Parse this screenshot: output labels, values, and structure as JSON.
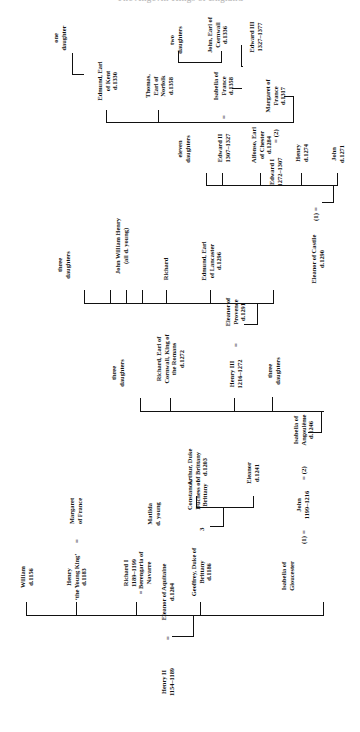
{
  "document": {
    "title": "The Angevin Kings of England",
    "kind": "genealogical-table",
    "orientation": "rotated-90-ccw"
  },
  "root": {
    "husband": {
      "name": "Henry II",
      "dates": "1154–1189"
    },
    "marriage_symbol": "=",
    "wife": {
      "name": "Eleanor of Aquitaine",
      "dates": "d.1204"
    }
  },
  "generation2": [
    {
      "id": "william",
      "lines": [
        "William",
        "d.1156"
      ]
    },
    {
      "id": "henry-young-king",
      "lines": [
        "Henry",
        "‘the Young King’",
        "d.1183"
      ]
    },
    {
      "id": "margaret-france",
      "lines": [
        "Margaret",
        "of France"
      ],
      "marriage_symbol": "="
    },
    {
      "id": "richard-i",
      "lines": [
        "Richard I",
        "1189–1199",
        "= Berengaria of",
        "Navarre"
      ]
    },
    {
      "id": "geoffrey-brittany",
      "lines": [
        "Geoffrey, Duke of",
        "Brittany",
        "d.1186"
      ],
      "marriage_symbol": "="
    },
    {
      "id": "constance-brittany",
      "lines": [
        "Constance,",
        "Duchess of",
        "Brittany"
      ]
    },
    {
      "id": "john-king",
      "lines": [
        "John",
        "1199–1216"
      ],
      "marriage_1": "(1) =",
      "marriage_2": "= (2)"
    },
    {
      "id": "isabella-gloucester",
      "lines": [
        "Isabella of",
        "Gloucester"
      ]
    },
    {
      "id": "isabella-angouleme",
      "lines": [
        "Isabella of",
        "Angoulême",
        "d.1246"
      ]
    }
  ],
  "generation3": [
    {
      "id": "arthur-brittany",
      "lines": [
        "Arthur, Duke",
        "of Brittany",
        "d.1203"
      ]
    },
    {
      "id": "eleanor-1241",
      "lines": [
        "Eleanor",
        "d.1241"
      ]
    },
    {
      "id": "matilda",
      "lines": [
        "Matilda",
        "d. young"
      ]
    },
    {
      "id": "henry-iii",
      "lines": [
        "Henry III",
        "1216–1272"
      ],
      "marriage_symbol": "="
    },
    {
      "id": "eleanor-provence",
      "lines": [
        "Eleanor of",
        "Provence",
        "d.1291"
      ]
    },
    {
      "id": "richard-cornwall",
      "lines": [
        "Richard, Earl of",
        "Cornwall, King of",
        "the Romans",
        "d.1272"
      ]
    },
    {
      "id": "john-three-daughters-a",
      "lines": [
        "three",
        "daughters"
      ]
    },
    {
      "id": "john-three-daughters-b",
      "lines": [
        "three",
        "daughters"
      ]
    }
  ],
  "generation4": [
    {
      "id": "edward-i",
      "lines": [
        "Edward I",
        "1272–1307"
      ],
      "marriage_1": "(1) =",
      "marriage_2": "= (2)"
    },
    {
      "id": "eleanor-castile",
      "lines": [
        "Eleanor of Castile",
        "d.1290"
      ]
    },
    {
      "id": "margaret-france-2",
      "lines": [
        "Margaret of",
        "France",
        "d.1317"
      ]
    },
    {
      "id": "edmund-lancaster",
      "lines": [
        "Edmund, Earl",
        "of Lancaster",
        "d.1296"
      ]
    },
    {
      "id": "richard-son",
      "lines": [
        "Richard"
      ]
    },
    {
      "id": "john-william-henry",
      "lines": [
        "John   William   Henry",
        "(all d. young)"
      ]
    },
    {
      "id": "henry-iii-three-daughters",
      "lines": [
        "three",
        "daughters"
      ]
    }
  ],
  "generation5": [
    {
      "id": "john-1271",
      "lines": [
        "John",
        "d.1271"
      ]
    },
    {
      "id": "henry-1274",
      "lines": [
        "Henry",
        "d.1274"
      ]
    },
    {
      "id": "alfonso-chester",
      "lines": [
        "Alfonso, Earl",
        "of Chester",
        "d.1284"
      ]
    },
    {
      "id": "edward-ii",
      "lines": [
        "Edward II",
        "1307–1327"
      ],
      "marriage_symbol": "="
    },
    {
      "id": "isabella-france",
      "lines": [
        "Isabella of",
        "France",
        "d.1358"
      ]
    },
    {
      "id": "eleven-daughters",
      "lines": [
        "eleven",
        "daughters"
      ]
    },
    {
      "id": "thomas-norfolk",
      "lines": [
        "Thomas,",
        "Earl of",
        "Norfolk",
        "d.1358"
      ]
    },
    {
      "id": "edmund-kent",
      "lines": [
        "Edmund, Earl",
        "of Kent",
        "d.1330"
      ]
    }
  ],
  "generation6": [
    {
      "id": "edward-iii",
      "lines": [
        "Edward III",
        "1327–1377"
      ]
    },
    {
      "id": "john-cornwall",
      "lines": [
        "John, Earl of",
        "Cornwall",
        "d.1336"
      ]
    },
    {
      "id": "two-daughters",
      "lines": [
        "two",
        "daughters"
      ]
    },
    {
      "id": "one-daughter",
      "lines": [
        "one",
        "daughter"
      ]
    }
  ],
  "symbols": {
    "marriage": "=",
    "first_marriage": "(1) =",
    "second_marriage": "= (2)"
  }
}
